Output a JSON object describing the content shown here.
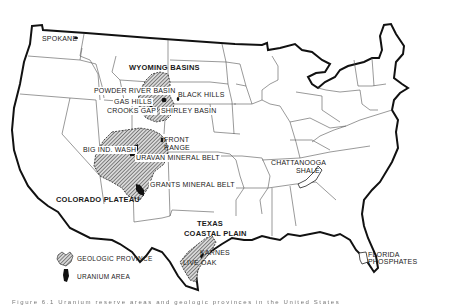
{
  "map": {
    "subject": "Uranium areas and geologic provinces of the United States",
    "colors": {
      "background": "#ffffff",
      "outline": "#111111",
      "state_lines": "#555555",
      "hatch": "#444444",
      "uranium": "#111111"
    },
    "labels": {
      "spokane": "SPOKANE",
      "wyoming_basins": "WYOMING BASINS",
      "powder_river_basin": "POWDER RIVER BASIN",
      "black_hills": "BLACK HILLS",
      "gas_hills": "GAS HILLS",
      "crooks_gap": "CROOKS GAP",
      "shirley_basin": "SHIRLEY BASIN",
      "front_range_1": "FRONT",
      "front_range_2": "RANGE",
      "big_indian_wash": "BIG IND. WASH",
      "uravan_mineral_belt": "URAVAN MINERAL BELT",
      "grants_mineral_belt": "GRANTS MINERAL BELT",
      "colorado_plateau": "COLORADO PLATEAU",
      "texas_coastal_plain_1": "TEXAS",
      "texas_coastal_plain_2": "COASTAL PLAIN",
      "karnes": "KARNES",
      "live_oak": "LIVE OAK",
      "chattanooga_shale_1": "CHATTANOOGA",
      "chattanooga_shale_2": "SHALE",
      "florida_phosphates_1": "FLORIDA",
      "florida_phosphates_2": "PHOSPHATES"
    },
    "legend": {
      "items": [
        {
          "label": "GEOLOGIC PROVINCE",
          "symbol": "hatched-area"
        },
        {
          "label": "URANIUM AREA",
          "symbol": "solid-black-area"
        }
      ]
    },
    "caption": "Figure 6.1   Uranium reserve areas and geologic provinces in the United States"
  }
}
